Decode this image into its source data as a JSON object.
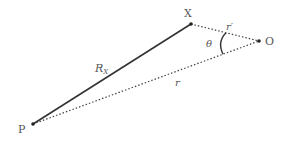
{
  "diagram": {
    "points": {
      "X": {
        "label": "X",
        "x": 191,
        "y": 24
      },
      "O": {
        "label": "O",
        "x": 259,
        "y": 41
      },
      "P": {
        "label": "P",
        "x": 33,
        "y": 124
      }
    },
    "segments": [
      {
        "from": "P",
        "to": "X",
        "style": "solid",
        "label": "R",
        "subscript": "X"
      },
      {
        "from": "P",
        "to": "O",
        "style": "dotted",
        "label": "r"
      },
      {
        "from": "X",
        "to": "O",
        "style": "dotted",
        "label": "r′"
      }
    ],
    "angle": {
      "vertex": "O",
      "label": "θ"
    },
    "colors": {
      "line": "#333333",
      "text": "#555555"
    }
  }
}
